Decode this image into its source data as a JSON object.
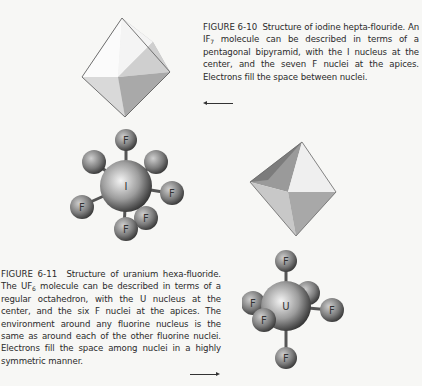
{
  "figures": [
    {
      "label": "FIGURE 6-10",
      "caption_start": "Structure of iodine hepta-flouride. An IF",
      "subscript": "7",
      "caption_end": " molecule can be described in terms of a pentagonal bipyramid, with the I nucleus at the center, and the seven F nuclei at the apices. Electrons fill the space between nuclei.",
      "arrow": "left",
      "central_atom": "I",
      "ligand_atom": "F",
      "ligand_count": 7,
      "polyhedron": "pentagonal bipyramid"
    },
    {
      "label": "FIGURE 6-11",
      "caption_start": "Structure of uranium hexa-fluoride. The UF",
      "subscript": "6",
      "caption_end": " molecule can be described in terms of a regular octahedron, with the U nucleus at the center, and the six F nuclei at the apices. The environment around any fluorine nucleus is the same as around each of the other fluorine nuclei. Electrons fill the space among nuclei in a highly symmetric manner.",
      "arrow": "right",
      "central_atom": "U",
      "ligand_atom": "F",
      "ligand_count": 6,
      "polyhedron": "octahedron"
    }
  ],
  "atom_labels": {
    "i_center": "I",
    "u_center": "U",
    "f": "F"
  }
}
